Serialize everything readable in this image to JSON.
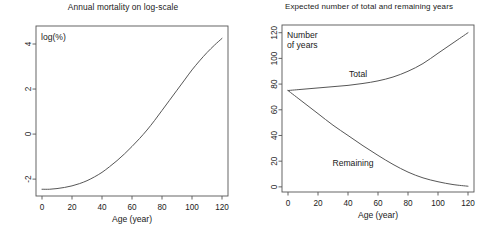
{
  "figure": {
    "width": 492,
    "height": 230,
    "background": "#ffffff",
    "line_color": "#4d4d4d",
    "axis_color": "#555555",
    "text_color": "#1a1a1a"
  },
  "panels": [
    {
      "id": "left",
      "title": "Annual mortality on log-scale",
      "corner_label": "log(%)",
      "xlabel": "Age (year)",
      "x_ticks": [
        0,
        20,
        40,
        60,
        80,
        100,
        120
      ],
      "y_ticks": [
        -2,
        0,
        2,
        4
      ]
    },
    {
      "id": "right",
      "title": "Expected number of total and remaining years",
      "corner_label_line1": "Number",
      "corner_label_line2": "of years",
      "xlabel": "Age (year)",
      "x_ticks": [
        0,
        20,
        40,
        60,
        80,
        100,
        120
      ],
      "y_ticks": [
        0,
        20,
        40,
        60,
        80,
        100,
        120
      ],
      "series_labels": {
        "total": "Total",
        "remaining": "Remaining"
      }
    }
  ],
  "chart_data": [
    {
      "type": "line",
      "panel": "left",
      "title": "Annual mortality on log-scale",
      "xlabel": "Age (year)",
      "ylabel": "log(%)",
      "xlim": [
        -4,
        124
      ],
      "ylim": [
        -2.75,
        4.8
      ],
      "grid": false,
      "legend": "none",
      "annotations": [
        "log(%)"
      ],
      "x": [
        0,
        5,
        10,
        15,
        20,
        25,
        30,
        35,
        40,
        45,
        50,
        55,
        60,
        65,
        70,
        75,
        80,
        85,
        90,
        95,
        100,
        105,
        110,
        115,
        120
      ],
      "series": [
        {
          "name": "log annual mortality (%)",
          "values": [
            -2.45,
            -2.45,
            -2.42,
            -2.37,
            -2.3,
            -2.2,
            -2.07,
            -1.9,
            -1.7,
            -1.45,
            -1.18,
            -0.88,
            -0.55,
            -0.2,
            0.18,
            0.6,
            1.05,
            1.5,
            1.95,
            2.4,
            2.85,
            3.25,
            3.62,
            3.95,
            4.25
          ]
        }
      ]
    },
    {
      "type": "line",
      "panel": "right",
      "title": "Expected number of total and remaining years",
      "xlabel": "Age (year)",
      "ylabel": "Number of years",
      "xlim": [
        -4,
        124
      ],
      "ylim": [
        -4,
        126
      ],
      "grid": false,
      "legend": "inline-labels",
      "annotations": [
        "Number of years",
        "Total",
        "Remaining"
      ],
      "x": [
        0,
        10,
        20,
        30,
        40,
        50,
        60,
        70,
        80,
        90,
        100,
        110,
        120
      ],
      "series": [
        {
          "name": "Total",
          "values": [
            75,
            76,
            77,
            78,
            79,
            80.5,
            82.5,
            85.5,
            90,
            96,
            104,
            112,
            120
          ]
        },
        {
          "name": "Remaining",
          "values": [
            75,
            66,
            57,
            48,
            40,
            32,
            24.5,
            17.5,
            11.5,
            7,
            4,
            1.8,
            0.5
          ]
        }
      ]
    }
  ]
}
